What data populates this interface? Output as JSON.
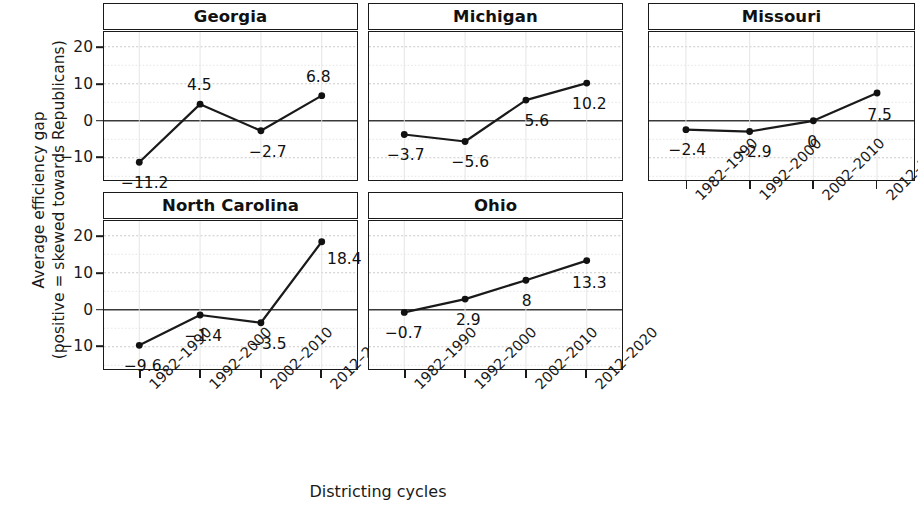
{
  "chart_data": {
    "type": "line",
    "title": "",
    "xlabel": "Districting cycles",
    "ylabel": "Average efficiency gap (positive = skewed towards Republicans)",
    "ylabel_line1": "Average efficiency gap",
    "ylabel_line2": "(positive = skewed towards Republicans)",
    "categories": [
      "1982–1990",
      "1992–2000",
      "2002–2010",
      "2012–2020"
    ],
    "ylim": [
      -16,
      24
    ],
    "yticks": [
      20,
      10,
      0,
      -10
    ],
    "ytick_labels": [
      "20",
      "10",
      "0",
      "−10"
    ],
    "grid": true,
    "legend": "none",
    "facet": true,
    "series": [
      {
        "name": "Georgia",
        "values": [
          -11.2,
          4.5,
          -2.7,
          6.8
        ],
        "labels": [
          "−11.2",
          "4.5",
          "−2.7",
          "6.8"
        ]
      },
      {
        "name": "Michigan",
        "values": [
          -3.7,
          -5.6,
          5.6,
          10.2
        ],
        "labels": [
          "−3.7",
          "−5.6",
          "5.6",
          "10.2"
        ]
      },
      {
        "name": "Missouri",
        "values": [
          -2.4,
          -2.9,
          0,
          7.5
        ],
        "labels": [
          "−2.4",
          "−2.9",
          "0",
          "7.5"
        ]
      },
      {
        "name": "North Carolina",
        "values": [
          -9.6,
          -1.4,
          -3.5,
          18.4
        ],
        "labels": [
          "−9.6",
          "−1.4",
          "−3.5",
          "18.4"
        ]
      },
      {
        "name": "Ohio",
        "values": [
          -0.7,
          2.9,
          8,
          13.3
        ],
        "labels": [
          "−0.7",
          "2.9",
          "8",
          "13.3"
        ]
      }
    ]
  },
  "panels": [
    {
      "title": "Georgia",
      "series_index": 0,
      "label_offsets": [
        {
          "dx": 4,
          "dy": 20
        },
        {
          "dx": -2,
          "dy": -20
        },
        {
          "dx": 6,
          "dy": 20
        },
        {
          "dx": -4,
          "dy": -20
        }
      ],
      "show_xaxis": false,
      "show_yaxis": true,
      "col": 0,
      "row": 0
    },
    {
      "title": "Michigan",
      "series_index": 1,
      "label_offsets": [
        {
          "dx": 0,
          "dy": 20
        },
        {
          "dx": 4,
          "dy": 20
        },
        {
          "dx": 10,
          "dy": 20
        },
        {
          "dx": 2,
          "dy": 20
        }
      ],
      "show_xaxis": false,
      "show_yaxis": false,
      "col": 1,
      "row": 0
    },
    {
      "title": "Missouri",
      "series_index": 2,
      "label_offsets": [
        {
          "dx": 0,
          "dy": 20
        },
        {
          "dx": 2,
          "dy": 20
        },
        {
          "dx": -2,
          "dy": 20
        },
        {
          "dx": 2,
          "dy": 21
        }
      ],
      "show_xaxis": true,
      "show_yaxis": false,
      "col": 2,
      "row": 0
    },
    {
      "title": "North Carolina",
      "series_index": 3,
      "label_offsets": [
        {
          "dx": 2,
          "dy": 20
        },
        {
          "dx": 2,
          "dy": 20
        },
        {
          "dx": 6,
          "dy": 20
        },
        {
          "dx": 22,
          "dy": 16
        }
      ],
      "show_xaxis": true,
      "show_yaxis": true,
      "col": 0,
      "row": 1
    },
    {
      "title": "Ohio",
      "series_index": 4,
      "label_offsets": [
        {
          "dx": -2,
          "dy": 20
        },
        {
          "dx": 2,
          "dy": 20
        },
        {
          "dx": 0,
          "dy": 20
        },
        {
          "dx": 2,
          "dy": 21
        }
      ],
      "show_xaxis": true,
      "show_yaxis": false,
      "col": 1,
      "row": 1
    }
  ],
  "style": {
    "line_color": "#1a1a1a",
    "point_color": "#111111",
    "grid_major_color": "#c9c9c9",
    "grid_minor_color": "#e2e2e2",
    "zero_line_color": "#3a3a3a",
    "panel_border_color": "#1a1a1a",
    "background": "#ffffff"
  }
}
